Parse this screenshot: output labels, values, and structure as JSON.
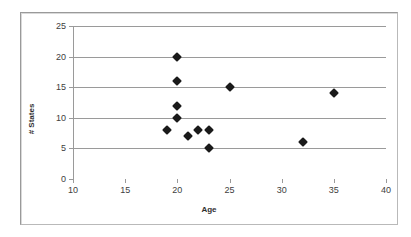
{
  "chart_data": {
    "type": "scatter",
    "title": "",
    "xlabel": "Age",
    "ylabel": "# States",
    "xlim": [
      10,
      40
    ],
    "ylim": [
      0,
      25
    ],
    "xticks": [
      10,
      15,
      20,
      25,
      30,
      35,
      40
    ],
    "yticks": [
      0,
      5,
      10,
      15,
      20,
      25
    ],
    "grid": "horizontal",
    "legend": "none",
    "marker": "diamond",
    "marker_color": "#1a1a1a",
    "series": [
      {
        "name": "states by minimum age",
        "points": [
          {
            "x": 19,
            "y": 8
          },
          {
            "x": 20,
            "y": 20
          },
          {
            "x": 20,
            "y": 16
          },
          {
            "x": 20,
            "y": 12
          },
          {
            "x": 20,
            "y": 10
          },
          {
            "x": 21,
            "y": 7
          },
          {
            "x": 22,
            "y": 8
          },
          {
            "x": 23,
            "y": 8
          },
          {
            "x": 23,
            "y": 5
          },
          {
            "x": 25,
            "y": 15
          },
          {
            "x": 32,
            "y": 6
          },
          {
            "x": 35,
            "y": 14
          }
        ]
      }
    ]
  },
  "axes": {
    "x_tick_labels": [
      "10",
      "15",
      "20",
      "25",
      "30",
      "35",
      "40"
    ],
    "y_tick_labels": [
      "0",
      "5",
      "10",
      "15",
      "20",
      "25"
    ],
    "x_title": "Age",
    "y_title": "# States"
  },
  "colors": {
    "gridline": "#9a9a9a",
    "marker": "#1a1a1a",
    "frame": "#9a9a9a",
    "background": "#ffffff",
    "tick_text": "#404040"
  }
}
